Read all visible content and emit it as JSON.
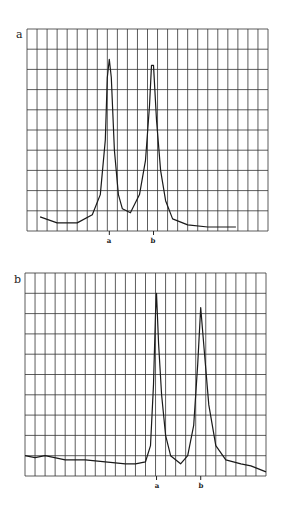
{
  "chart_data": [
    {
      "type": "line",
      "panel_label": "a",
      "title": "",
      "xlabel": "",
      "ylabel": "",
      "grid": true,
      "grid_columns": 24,
      "grid_rows": 10,
      "ylim": [
        0,
        10
      ],
      "x_markers": [
        "a",
        "b"
      ],
      "x_marker_positions_col": [
        8.2,
        12.6
      ],
      "series": [
        {
          "name": "trace",
          "x": [
            1.3,
            3,
            5,
            6.5,
            7.3,
            7.8,
            8.0,
            8.2,
            8.4,
            8.7,
            9.1,
            9.5,
            10.3,
            11.2,
            11.8,
            12.2,
            12.4,
            12.6,
            12.9,
            13.3,
            13.8,
            14.5,
            16,
            18,
            20.8
          ],
          "values": [
            0.7,
            0.4,
            0.4,
            0.8,
            1.8,
            4.5,
            7.6,
            8.5,
            7.6,
            4.0,
            1.8,
            1.1,
            0.9,
            1.8,
            3.5,
            6.2,
            8.2,
            8.2,
            5.5,
            3.0,
            1.5,
            0.6,
            0.3,
            0.2,
            0.2
          ]
        }
      ]
    },
    {
      "type": "line",
      "panel_label": "b",
      "title": "",
      "xlabel": "",
      "ylabel": "",
      "grid": true,
      "grid_columns": 24,
      "grid_rows": 10,
      "ylim": [
        0,
        10
      ],
      "x_markers": [
        "a",
        "b"
      ],
      "x_marker_positions_col": [
        13.1,
        17.5
      ],
      "series": [
        {
          "name": "trace",
          "x": [
            0,
            1,
            2,
            4,
            6,
            8,
            10,
            11,
            12,
            12.5,
            12.8,
            13.0,
            13.1,
            13.3,
            13.6,
            14,
            14.5,
            15.5,
            16.2,
            16.8,
            17.2,
            17.5,
            17.8,
            18.3,
            19,
            20,
            21.5,
            22.5,
            24
          ],
          "values": [
            1.0,
            0.9,
            1.0,
            0.8,
            0.8,
            0.7,
            0.6,
            0.6,
            0.7,
            1.5,
            4.5,
            8.0,
            9.0,
            6.5,
            4.0,
            2.0,
            1.0,
            0.6,
            1.0,
            2.5,
            5.5,
            8.3,
            6.5,
            3.5,
            1.5,
            0.8,
            0.6,
            0.5,
            0.2
          ]
        }
      ]
    }
  ]
}
